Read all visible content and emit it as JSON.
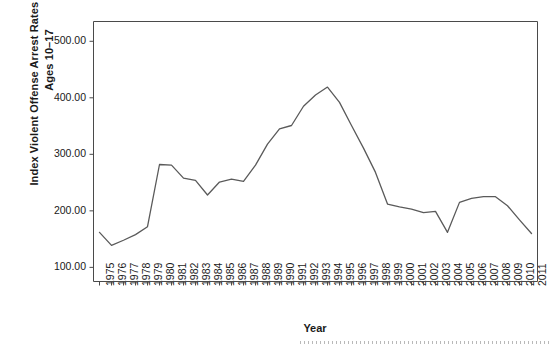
{
  "chart_data": {
    "type": "line",
    "title": "",
    "xlabel": "Year",
    "ylabel": "Index Violent Offense Arrest Rates per 100,000, Ages 10–17",
    "ylabel_line1": "Index Violent Offense Arrest Rates per 100,000,",
    "ylabel_line2": "Ages 10–17",
    "grid": false,
    "legend": "none",
    "ylim": [
      75,
      535
    ],
    "ytick_values": [
      100,
      200,
      300,
      400,
      500
    ],
    "ytick_labels": [
      "100.00",
      "200.00",
      "300.00",
      "400.00",
      "500.00"
    ],
    "categories": [
      "1975",
      "1976",
      "1977",
      "1978",
      "1979",
      "1980",
      "1981",
      "1982",
      "1983",
      "1984",
      "1985",
      "1986",
      "1987",
      "1988",
      "1989",
      "1990",
      "1991",
      "1992",
      "1993",
      "1994",
      "1995",
      "1996",
      "1997",
      "1998",
      "1999",
      "2000",
      "2001",
      "2002",
      "2003",
      "2004",
      "2005",
      "2006",
      "2007",
      "2008",
      "2009",
      "2010",
      "2011"
    ],
    "series": [
      {
        "name": "Index Violent Offense Arrest Rate",
        "color": "#5a5a5a",
        "values": [
          162,
          139,
          148,
          158,
          172,
          282,
          281,
          258,
          254,
          228,
          251,
          256,
          252,
          281,
          318,
          345,
          351,
          385,
          405,
          419,
          392,
          351,
          311,
          268,
          212,
          207,
          203,
          197,
          199,
          162,
          215,
          222,
          225,
          225,
          209,
          184,
          160
        ]
      }
    ]
  },
  "axes": {
    "x_axis_name": "year-axis",
    "y_axis_name": "arrest-rate-axis"
  }
}
